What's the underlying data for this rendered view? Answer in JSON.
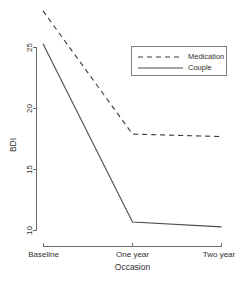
{
  "chart_data": {
    "type": "line",
    "title": "",
    "xlabel": "Occasion",
    "ylabel": "BDI",
    "categories": [
      "Baseline",
      "One year",
      "Two year"
    ],
    "series": [
      {
        "name": "Medication",
        "style": "dashed",
        "values": [
          28.0,
          17.9,
          17.7
        ]
      },
      {
        "name": "Couple",
        "style": "solid",
        "values": [
          25.3,
          10.7,
          10.3
        ]
      }
    ],
    "yticks": [
      10,
      15,
      20,
      25
    ],
    "ytick_labels": [
      "10",
      "15",
      "20",
      "25"
    ],
    "ylim": [
      9.8,
      28.4
    ],
    "grid": false,
    "legend_position": "top-right",
    "legend_entries": [
      "Medication",
      "Couple"
    ],
    "colors": {
      "medication_line": "#3a3a3a",
      "couple_line": "#4a4a4a",
      "axis": "#6b6b6b",
      "legend_border": "#7d7d7d",
      "text": "#2f2f2f",
      "background": "#ffffff"
    }
  },
  "axes": {
    "y_title": "BDI",
    "x_title": "Occasion",
    "y_tick_0": "10",
    "y_tick_1": "15",
    "y_tick_2": "20",
    "y_tick_3": "25",
    "x_tick_0": "Baseline",
    "x_tick_1": "One year",
    "x_tick_2": "Two year"
  },
  "legend": {
    "entry_0": "Medication",
    "entry_1": "Couple"
  }
}
